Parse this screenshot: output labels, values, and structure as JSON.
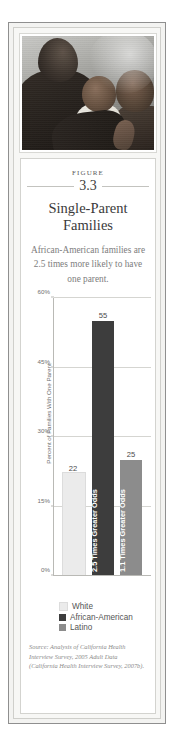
{
  "figure": {
    "label": "FIGURE",
    "number": "3.3",
    "title_line1": "Single-Parent",
    "title_line2": "Families",
    "subtitle": "African-American families are 2.5 times more likely to have one parent.",
    "photo_alt": "mother-with-two-children-photo",
    "source": "Source: Analysis of California Health Interview Survey, 2005 Adult Data (California Health Interview Survey, 2007b)."
  },
  "colors": {
    "white_bar": "#ebebeb",
    "african_american_bar": "#3d3d3d",
    "latino_bar": "#8c8c8c",
    "gridline": "#d5d5d1",
    "axis": "#b9b9b5",
    "frame": "#8f8f8f"
  },
  "chart_data": {
    "type": "bar",
    "title": "Single-Parent Families",
    "categories": [
      "White",
      "African-American",
      "Latino"
    ],
    "values": [
      22,
      55,
      25
    ],
    "value_labels": [
      "22",
      "55",
      "25"
    ],
    "bar_annotations": [
      "",
      "2.5 Times Greater Odds",
      "1.1 Times Greater Odds"
    ],
    "xlabel": "",
    "ylabel": "Percent of Families With One Parent",
    "ylim": [
      0,
      60
    ],
    "yticks": [
      0,
      15,
      30,
      45,
      60
    ],
    "ytick_labels": [
      "0%",
      "15%",
      "30%",
      "45%",
      "60%"
    ],
    "grid": true,
    "legend_position": "bottom",
    "legend": [
      {
        "label": "White",
        "color": "#ebebeb"
      },
      {
        "label": "African-American",
        "color": "#3d3d3d"
      },
      {
        "label": "Latino",
        "color": "#8c8c8c"
      }
    ]
  }
}
